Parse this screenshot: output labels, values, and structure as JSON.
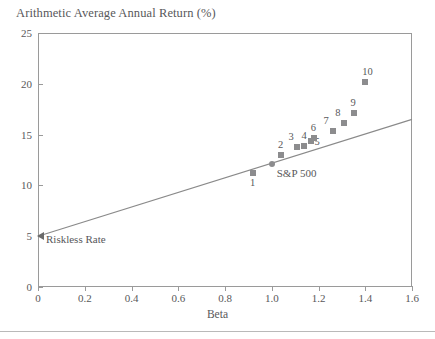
{
  "chart_data": {
    "type": "scatter",
    "title": "Arithmetic Average Annual Return (%)",
    "xlabel": "Beta",
    "ylabel": "",
    "xlim": [
      0,
      1.6
    ],
    "ylim": [
      0,
      25
    ],
    "grid": false,
    "legend": "none",
    "xticks": [
      "0",
      "0.2",
      "0.4",
      "0.6",
      "0.8",
      "1.0",
      "1.2",
      "1.4",
      "1.6"
    ],
    "xtick_values": [
      0,
      0.2,
      0.4,
      0.6,
      0.8,
      1.0,
      1.2,
      1.4,
      1.6
    ],
    "yticks": [
      "0",
      "5",
      "10",
      "15",
      "20",
      "25"
    ],
    "ytick_values": [
      0,
      5,
      10,
      15,
      20,
      25
    ],
    "points": [
      {
        "label": "1",
        "x": 0.92,
        "y": 11.2,
        "marker": "square",
        "label_pos": "below"
      },
      {
        "label": "2",
        "x": 1.04,
        "y": 13.0,
        "marker": "square",
        "label_pos": "above"
      },
      {
        "label": "3",
        "x": 1.11,
        "y": 13.8,
        "marker": "square",
        "label_pos": "above-left"
      },
      {
        "label": "4",
        "x": 1.14,
        "y": 13.9,
        "marker": "square",
        "label_pos": "above"
      },
      {
        "label": "5",
        "x": 1.17,
        "y": 14.4,
        "marker": "square",
        "label_pos": "below-right"
      },
      {
        "label": "6",
        "x": 1.18,
        "y": 14.7,
        "marker": "square",
        "label_pos": "above"
      },
      {
        "label": "7",
        "x": 1.26,
        "y": 15.4,
        "marker": "square",
        "label_pos": "above-left"
      },
      {
        "label": "8",
        "x": 1.31,
        "y": 16.1,
        "marker": "square",
        "label_pos": "above-left"
      },
      {
        "label": "9",
        "x": 1.35,
        "y": 17.1,
        "marker": "square",
        "label_pos": "above"
      },
      {
        "label": "10",
        "x": 1.4,
        "y": 20.2,
        "marker": "square",
        "label_pos": "above"
      }
    ],
    "special_points": [
      {
        "label": "S&P 500",
        "x": 1.0,
        "y": 12.1,
        "marker": "circle"
      },
      {
        "label": "Riskless Rate",
        "x": 0.0,
        "y": 5.0,
        "marker": "triangle"
      }
    ],
    "line": {
      "name": "Security Market Line",
      "x": [
        0,
        1.6
      ],
      "y": [
        5.0,
        16.5
      ],
      "color": "#8a8a8a"
    },
    "colors": {
      "marker": "#8c8c8e",
      "line": "#8a8a8a",
      "axis": "#9a9a9a",
      "text": "#58585a",
      "background": "#ffffff"
    }
  }
}
